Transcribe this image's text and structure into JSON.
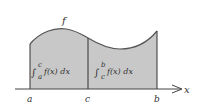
{
  "figure": {
    "function_label": "f",
    "axis_label": "x",
    "points": {
      "a": "a",
      "c": "c",
      "b": "b"
    },
    "region_left": {
      "integral_sign": "∫",
      "upper": "c",
      "lower": "a",
      "integrand": "f(x) dx"
    },
    "region_right": {
      "integral_sign": "∫",
      "upper": "b",
      "lower": "c",
      "integrand": "f(x) dx"
    },
    "colors": {
      "fill": "#c8c8c8",
      "stroke": "#555555",
      "background": "#ffffff"
    }
  }
}
